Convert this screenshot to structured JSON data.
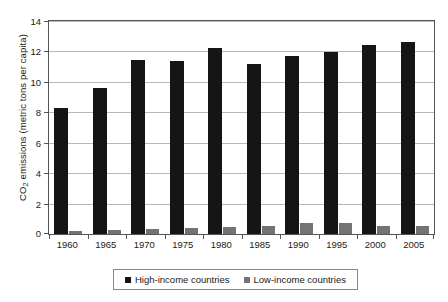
{
  "chart_data": {
    "type": "bar",
    "title": "",
    "subtitle": "",
    "xlabel": "",
    "ylabel": "CO2 emissions (metric tons per capita)",
    "ylabel_parts": {
      "pre": "CO",
      "sub": "2",
      "post": " emissions (metric tons per capita)"
    },
    "categories": [
      "1960",
      "1965",
      "1970",
      "1975",
      "1980",
      "1985",
      "1990",
      "1995",
      "2000",
      "2005"
    ],
    "series": [
      {
        "name": "High-income countries",
        "color": "#151515",
        "values": [
          8.3,
          9.6,
          11.45,
          11.4,
          12.2,
          11.2,
          11.7,
          11.95,
          12.45,
          12.6
        ]
      },
      {
        "name": "Low-income countries",
        "color": "#737373",
        "values": [
          0.2,
          0.25,
          0.35,
          0.4,
          0.45,
          0.55,
          0.75,
          0.7,
          0.5,
          0.55
        ]
      }
    ],
    "ylim": [
      0,
      14
    ],
    "yticks": [
      0,
      2,
      4,
      6,
      8,
      10,
      12,
      14
    ],
    "ytick_labels": [
      "0",
      "2",
      "4",
      "6",
      "8",
      "10",
      "12",
      "14"
    ],
    "grid": true,
    "grid_axis": "y",
    "legend": true,
    "legend_position": "bottom"
  }
}
